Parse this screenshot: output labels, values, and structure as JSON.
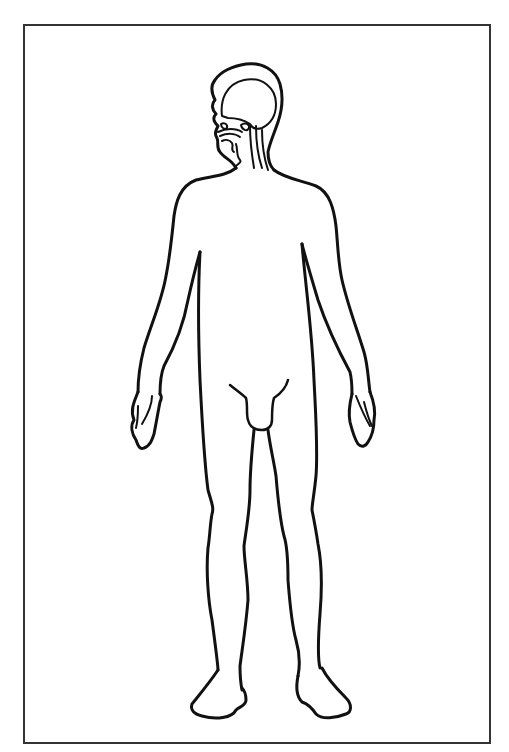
{
  "diagram": {
    "view": "front, head in profile with internal structures",
    "colors": {
      "stroke": "#111111",
      "frame": "#333333",
      "background": "#ffffff"
    },
    "parts": [
      {
        "id": "head",
        "label": "Head (sagittal section)"
      },
      {
        "id": "brain",
        "label": "Brain"
      },
      {
        "id": "nasal-cavity",
        "label": "Nasal cavity"
      },
      {
        "id": "oral-cavity",
        "label": "Oral cavity"
      },
      {
        "id": "spinal-cord",
        "label": "Spinal cord"
      },
      {
        "id": "torso",
        "label": "Torso"
      },
      {
        "id": "left-arm",
        "label": "Left arm"
      },
      {
        "id": "right-arm",
        "label": "Right arm"
      },
      {
        "id": "left-hand",
        "label": "Left hand"
      },
      {
        "id": "right-hand",
        "label": "Right hand"
      },
      {
        "id": "groin",
        "label": "Groin"
      },
      {
        "id": "left-leg",
        "label": "Left leg"
      },
      {
        "id": "right-leg",
        "label": "Right leg"
      },
      {
        "id": "left-foot",
        "label": "Left foot"
      },
      {
        "id": "right-foot",
        "label": "Right foot"
      }
    ]
  }
}
